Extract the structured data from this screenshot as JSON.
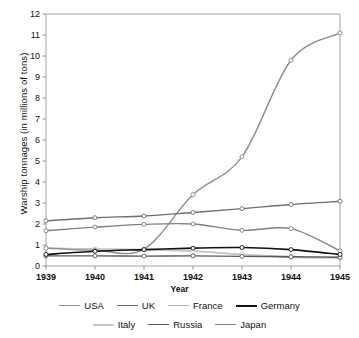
{
  "chart_data": {
    "type": "line",
    "title": "",
    "xlabel": "Year",
    "ylabel": "Warship tonnages (in millions of tons)",
    "categories": [
      "1939",
      "1940",
      "1941",
      "1942",
      "1943",
      "1944",
      "1945"
    ],
    "x": [
      1939,
      1940,
      1941,
      1942,
      1943,
      1944,
      1945
    ],
    "xlim": [
      1939,
      1945
    ],
    "ylim": [
      0,
      12
    ],
    "yticks": [
      0,
      1,
      2,
      3,
      4,
      5,
      6,
      7,
      8,
      9,
      10,
      11,
      12
    ],
    "grid": false,
    "legend_position": "bottom",
    "markers": "open-circle",
    "series": [
      {
        "name": "USA",
        "color": "#8c8c8c",
        "width": 1.4,
        "values": [
          0.85,
          0.75,
          0.8,
          3.4,
          5.2,
          9.8,
          11.1
        ]
      },
      {
        "name": "UK",
        "color": "#6e6e6e",
        "width": 1.4,
        "values": [
          2.15,
          2.3,
          2.38,
          2.55,
          2.73,
          2.93,
          3.08
        ]
      },
      {
        "name": "France",
        "color": "#b4b4b4",
        "width": 1.4,
        "values": [
          0.85,
          0.8,
          0.78,
          0.72,
          0.55,
          0.42,
          0.38
        ]
      },
      {
        "name": "Germany",
        "color": "#111111",
        "width": 1.6,
        "values": [
          0.55,
          0.7,
          0.78,
          0.85,
          0.88,
          0.78,
          0.55
        ]
      },
      {
        "name": "Italy",
        "color": "#c8c8c8",
        "width": 1.6,
        "values": [
          0.85,
          0.8,
          0.78,
          0.7,
          0.55,
          0.45,
          0.4
        ]
      },
      {
        "name": "Russia",
        "color": "#5a5a5a",
        "width": 1.4,
        "values": [
          0.48,
          0.48,
          0.47,
          0.48,
          0.46,
          0.44,
          0.42
        ]
      },
      {
        "name": "Japan",
        "color": "#808080",
        "width": 1.4,
        "values": [
          1.68,
          1.85,
          1.98,
          2.0,
          1.7,
          1.78,
          0.72
        ]
      }
    ]
  },
  "axis": {
    "y_tick_labels": [
      "12",
      "11",
      "10",
      "9",
      "8",
      "7",
      "6",
      "5",
      "4",
      "3",
      "2",
      "1",
      "0"
    ],
    "x_tick_labels": [
      "1939",
      "1940",
      "1941",
      "1942",
      "1943",
      "1944",
      "1945"
    ],
    "y_title": "Warship tonnages (in millions of tons)",
    "x_title": "Year"
  },
  "legend": {
    "rows": [
      [
        {
          "label": "USA",
          "color": "#8c8c8c",
          "width": 1.6
        },
        {
          "label": "UK",
          "color": "#6e6e6e",
          "width": 1.8
        },
        {
          "label": "France",
          "color": "#b4b4b4",
          "width": 1.6
        },
        {
          "label": "Germany",
          "color": "#111111",
          "width": 2.2
        }
      ],
      [
        {
          "label": "Italy",
          "color": "#c8c8c8",
          "width": 2.0
        },
        {
          "label": "Russia",
          "color": "#5a5a5a",
          "width": 1.9
        },
        {
          "label": "Japan",
          "color": "#808080",
          "width": 1.7
        }
      ]
    ]
  },
  "colors": {
    "frame": "#9a9a9a",
    "tick": "#8a8a8a",
    "text": "#111111",
    "background": "#ffffff"
  }
}
